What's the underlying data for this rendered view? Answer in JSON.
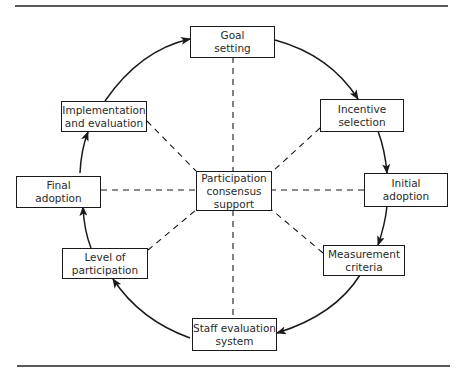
{
  "figure": {
    "caption_fragment": "Figure",
    "center_node": {
      "id": "center",
      "label_lines": [
        "Participation",
        "consensus",
        "support"
      ]
    },
    "cycle_nodes": [
      {
        "id": "goal",
        "label_lines": [
          "Goal",
          "setting"
        ]
      },
      {
        "id": "incentive",
        "label_lines": [
          "Incentive",
          "selection"
        ]
      },
      {
        "id": "initial",
        "label_lines": [
          "Initial",
          "adoption"
        ]
      },
      {
        "id": "measurement",
        "label_lines": [
          "Measurement",
          "criteria"
        ]
      },
      {
        "id": "staff",
        "label_lines": [
          "Staff evaluation",
          "system"
        ]
      },
      {
        "id": "level",
        "label_lines": [
          "Level of",
          "participation"
        ]
      },
      {
        "id": "final",
        "label_lines": [
          "Final",
          "adoption"
        ]
      },
      {
        "id": "implementation",
        "label_lines": [
          "Implementation",
          "and evaluation"
        ]
      }
    ],
    "cycle_edges": [
      [
        "goal",
        "incentive"
      ],
      [
        "incentive",
        "initial"
      ],
      [
        "initial",
        "measurement"
      ],
      [
        "measurement",
        "staff"
      ],
      [
        "staff",
        "level"
      ],
      [
        "level",
        "final"
      ],
      [
        "final",
        "implementation"
      ],
      [
        "implementation",
        "goal"
      ]
    ],
    "spoke_style": "dashed",
    "colors": {
      "ink": "#1a1a1a",
      "background": "#ffffff"
    }
  }
}
